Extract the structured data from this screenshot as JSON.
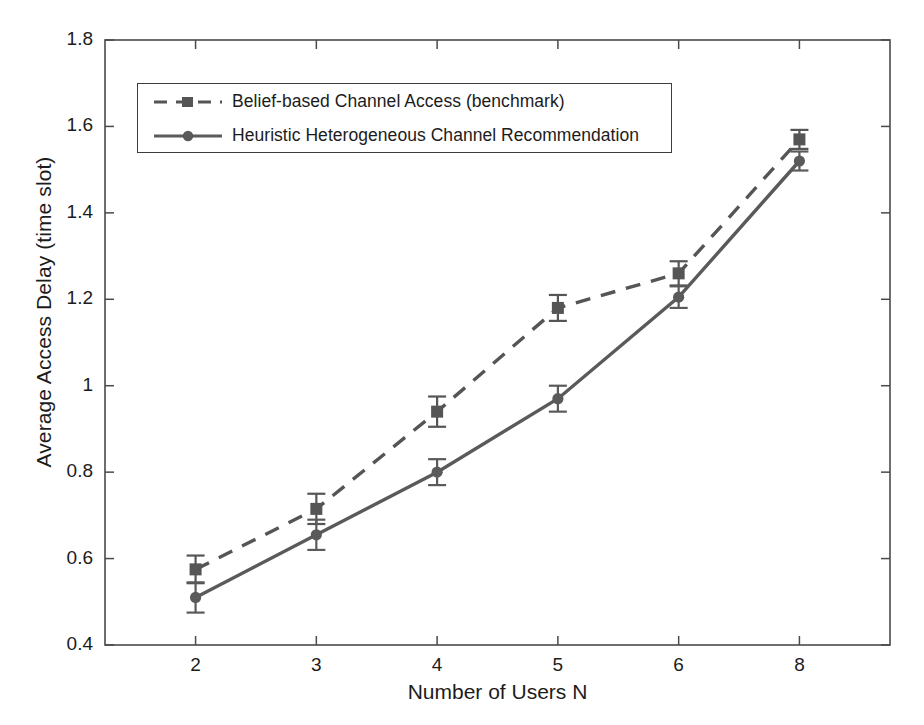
{
  "chart_data": {
    "type": "line",
    "title": "",
    "subtitle": "",
    "xlabel": "Number of  Users N",
    "ylabel": "Average Access Delay (time slot)",
    "categories": [
      "2",
      "3",
      "4",
      "5",
      "6",
      "8"
    ],
    "x": [
      2,
      3,
      4,
      5,
      6,
      8
    ],
    "x_is_categorical": true,
    "ylim": [
      0.4,
      1.8
    ],
    "ytick_labels": [
      "0.4",
      "0.6",
      "0.8",
      "1",
      "1.2",
      "1.4",
      "1.6",
      "1.8"
    ],
    "ytick_values": [
      0.4,
      0.6,
      0.8,
      1.0,
      1.2,
      1.4,
      1.6,
      1.8
    ],
    "grid": false,
    "legend_position": "upper-left-inside",
    "series": [
      {
        "name": "Belief-based Channel Access (benchmark)",
        "values": [
          0.575,
          0.715,
          0.94,
          1.18,
          1.26,
          1.57
        ],
        "yerr": [
          0.032,
          0.035,
          0.035,
          0.03,
          0.028,
          0.022
        ],
        "line_style": "dashed",
        "marker": "square",
        "color": "#555555"
      },
      {
        "name": "Heuristic Heterogeneous Channel Recommendation",
        "values": [
          0.51,
          0.655,
          0.8,
          0.97,
          1.205,
          1.52
        ],
        "yerr": [
          0.035,
          0.035,
          0.03,
          0.03,
          0.025,
          0.022
        ],
        "line_style": "solid",
        "marker": "circle",
        "color": "#5a5a5a"
      }
    ]
  },
  "axes": {
    "frame_color": "#4a4a4a",
    "background": "#ffffff"
  }
}
